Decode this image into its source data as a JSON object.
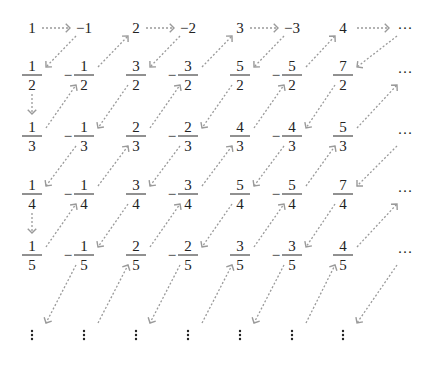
{
  "diagram": {
    "title": "",
    "colors": {
      "text": "#222222",
      "arrow": "#9a9a9a",
      "background": "#ffffff"
    },
    "columns_x": [
      32,
      84,
      136,
      188,
      240,
      292,
      343
    ],
    "ellipsis_col_x": 405,
    "top_row": {
      "y": 28,
      "items": [
        "1",
        "−1",
        "2",
        "−2",
        "3",
        "−3",
        "4"
      ],
      "trailing": "···"
    },
    "fraction_rows": [
      {
        "denominator": "2",
        "bar_y": 75,
        "numerators": [
          "1",
          "1",
          "3",
          "3",
          "5",
          "5",
          "7"
        ],
        "signs": [
          "",
          "−",
          "",
          "−",
          "",
          "−",
          ""
        ],
        "trailing": "···"
      },
      {
        "denominator": "3",
        "bar_y": 136,
        "numerators": [
          "1",
          "1",
          "2",
          "2",
          "4",
          "4",
          "5"
        ],
        "signs": [
          "",
          "−",
          "",
          "−",
          "",
          "−",
          ""
        ],
        "trailing": "···"
      },
      {
        "denominator": "4",
        "bar_y": 194,
        "numerators": [
          "1",
          "1",
          "3",
          "3",
          "5",
          "5",
          "7"
        ],
        "signs": [
          "",
          "−",
          "",
          "−",
          "",
          "−",
          ""
        ],
        "trailing": "···"
      },
      {
        "denominator": "5",
        "bar_y": 255,
        "numerators": [
          "1",
          "1",
          "2",
          "2",
          "3",
          "3",
          "4"
        ],
        "signs": [
          "",
          "−",
          "",
          "−",
          "",
          "−",
          ""
        ],
        "trailing": "···"
      }
    ],
    "bottom_vertical_ellipsis_y": 335,
    "row_centers_y": [
      28,
      80,
      139,
      197,
      258,
      320
    ],
    "arrows": {
      "horizontal": [
        {
          "from": "1",
          "to": "−1"
        },
        {
          "from": "2",
          "to": "−2"
        },
        {
          "from": "3",
          "to": "−3"
        },
        {
          "from": "4",
          "to": "···"
        }
      ],
      "vertical": [
        {
          "from": "1/2",
          "to": "1/3"
        },
        {
          "from": "1/4",
          "to": "1/5"
        }
      ],
      "diagonal_rule": "between adjacent rows, alternating down-left / up-right by column gap parity"
    }
  }
}
